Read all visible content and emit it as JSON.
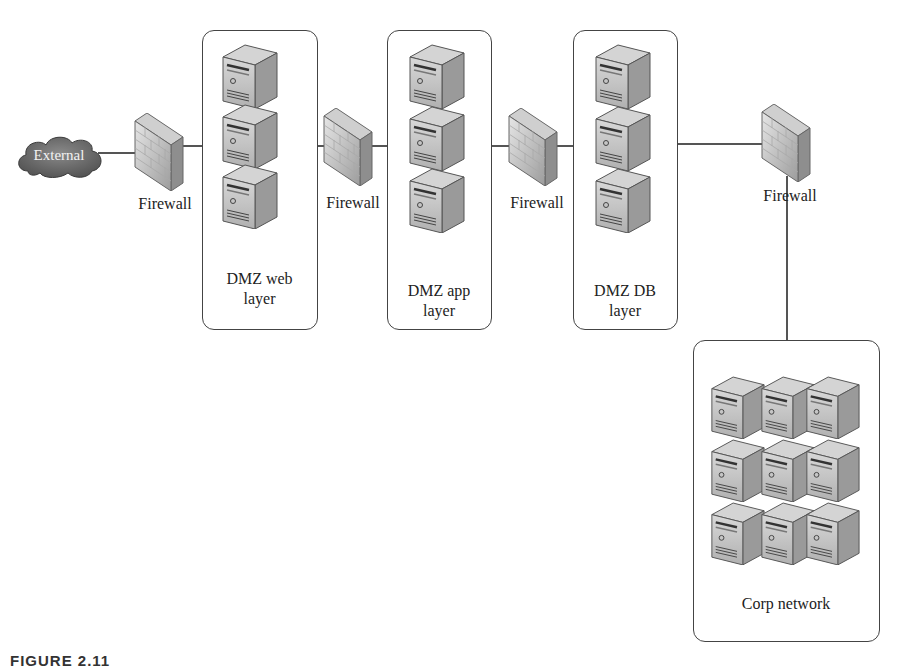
{
  "diagram": {
    "nodes": {
      "external": {
        "label": "External",
        "type": "cloud"
      },
      "firewall1": {
        "label": "Firewall",
        "type": "firewall"
      },
      "web": {
        "label_line1": "DMZ web",
        "label_line2": "layer",
        "type": "server-group",
        "servers": 3
      },
      "firewall2": {
        "label": "Firewall",
        "type": "firewall"
      },
      "app": {
        "label_line1": "DMZ app",
        "label_line2": "layer",
        "type": "server-group",
        "servers": 3
      },
      "firewall3": {
        "label": "Firewall",
        "type": "firewall"
      },
      "db": {
        "label_line1": "DMZ DB",
        "label_line2": "layer",
        "type": "server-group",
        "servers": 3
      },
      "firewall4": {
        "label": "Firewall",
        "type": "firewall"
      },
      "corp": {
        "label": "Corp network",
        "type": "server-group",
        "servers": 9
      }
    },
    "edges": [
      [
        "external",
        "firewall1"
      ],
      [
        "firewall1",
        "web"
      ],
      [
        "web",
        "firewall2"
      ],
      [
        "firewall2",
        "app"
      ],
      [
        "app",
        "firewall3"
      ],
      [
        "firewall3",
        "db"
      ],
      [
        "db",
        "firewall4"
      ],
      [
        "firewall4",
        "corp"
      ]
    ],
    "colors": {
      "line": "#555555",
      "border": "#444444",
      "cloud": "#6e6e6e",
      "server": "#9a9a9a"
    }
  },
  "caption": "FIGURE 2.11"
}
